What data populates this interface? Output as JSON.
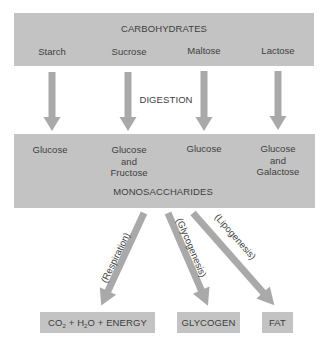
{
  "diagram": {
    "top_box": {
      "title": "CARBOHYDRATES",
      "items": [
        "Starch",
        "Sucrose",
        "Maltose",
        "Lactose"
      ]
    },
    "process_label": "DIGESTION",
    "middle_box": {
      "title": "MONOSACCHARIDES",
      "items": [
        {
          "line1": "Glucose",
          "line2": "",
          "line3": ""
        },
        {
          "line1": "Glucose",
          "line2": "and",
          "line3": "Fructose"
        },
        {
          "line1": "Glucose",
          "line2": "",
          "line3": ""
        },
        {
          "line1": "Glucose",
          "line2": "and",
          "line3": "Galactose"
        }
      ]
    },
    "pathways": [
      {
        "label": "(Respiration)",
        "product": {
          "co": "CO",
          "sub1": "2",
          "plus1": " + H",
          "sub2": "2",
          "rest": "O + ENERGY"
        }
      },
      {
        "label": "(Glycogenesis)",
        "product_label": "GLYCOGEN"
      },
      {
        "label": "(Lipogenesis)",
        "product_label": "FAT"
      }
    ],
    "colors": {
      "box_fill": "#c3c3c3",
      "arrow_fill": "#a9a9a9",
      "text": "#3e3e3e",
      "background": "#ffffff"
    }
  }
}
